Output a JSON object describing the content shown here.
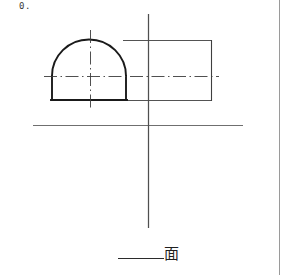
{
  "sheet": {
    "width": 281,
    "height": 275,
    "background": "#ffffff"
  },
  "problem": {
    "number_label": "0."
  },
  "answer": {
    "blank_label": "",
    "view_label": "面"
  },
  "colors": {
    "object_line": "#1a1a1a",
    "thin_line": "#4a4a4a",
    "axis_line": "#555555",
    "center_line": "#3c3c3c",
    "margin_rule": "#9a9a9a"
  },
  "drawing": {
    "title": "Orthographic projection exercise",
    "axes": {
      "vertical_axis": {
        "x": 148,
        "y1": 14,
        "y2": 228,
        "width": 1.1,
        "color": "#4f4f4f"
      },
      "horizontal_axis": {
        "y": 125,
        "x1": 33,
        "x2": 243,
        "width": 1.1,
        "color": "#6a6a6a"
      }
    },
    "shapes": [
      {
        "name": "d-shape-profile",
        "type": "semicircle-on-rectangle",
        "left": 51,
        "right": 125,
        "top": 40,
        "bottom": 100,
        "arc_spring_y": 76,
        "arc_radius_x": 37,
        "arc_radius_y": 36,
        "stroke_width": 1.9,
        "stroke": "#1a1a1a"
      },
      {
        "name": "side-rectangle",
        "type": "rectangle",
        "left": 125,
        "right": 212,
        "top": 40,
        "bottom": 100,
        "stroke_width": 0.9,
        "stroke": "#4a4a4a"
      }
    ],
    "center_lines": [
      {
        "name": "horizontal-center-line",
        "orientation": "horizontal",
        "y": 76,
        "x1": 44,
        "x2": 219,
        "dash": "dash-dot"
      },
      {
        "name": "vertical-center-line",
        "orientation": "vertical",
        "x": 90,
        "y1": 30,
        "y2": 111,
        "dash": "dash-dot"
      }
    ]
  }
}
